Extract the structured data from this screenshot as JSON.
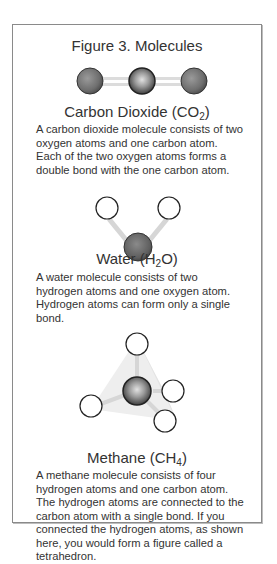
{
  "figure": {
    "title": "Figure 3. Molecules",
    "molecules": [
      {
        "name": "Carbon Dioxide",
        "formula_prefix": "CO",
        "formula_subscript": "2",
        "description": "A carbon dioxide molecule consists of two oxygen atoms and one carbon atom. Each of the two oxygen atoms forms a double bond with the one carbon atom."
      },
      {
        "name": "Water",
        "formula_prefix": "H",
        "formula_subscript": "2",
        "formula_suffix": "O",
        "description": "A water molecule consists of two hydrogen atoms and one oxygen atom. Hydrogen atoms can form only a single bond."
      },
      {
        "name": "Methane",
        "formula_prefix": "CH",
        "formula_subscript": "4",
        "description": "A methane molecule consists of four hydrogen atoms and one carbon atom. The hydrogen atoms are connected to the carbon atom with a single bond. If you connected the hydrogen atoms, as shown here, you would form a figure called a tetrahedron."
      }
    ]
  },
  "colors": {
    "border": "#8a8a8a",
    "atom_dark": "#5a5a5a",
    "atom_mid": "#8c8c8c",
    "bond": "#d9d9d9"
  }
}
